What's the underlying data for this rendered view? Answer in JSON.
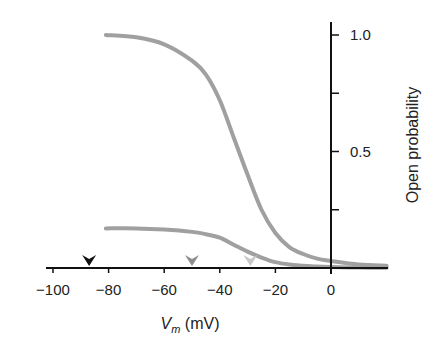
{
  "chart_data": {
    "type": "line",
    "title": "",
    "xlabel": "V_m (mV)",
    "xlabel_main": "V",
    "xlabel_sub": "m",
    "xlabel_unit": " (mV)",
    "ylabel": "Open probability",
    "xlim": [
      -100,
      20
    ],
    "ylim": [
      0,
      1.0
    ],
    "x_ticks": [
      -100,
      -80,
      -60,
      -40,
      -20,
      0
    ],
    "x_tick_labels": [
      "−100",
      "−80",
      "−60",
      "−40",
      "−20",
      "0"
    ],
    "y_ticks": [
      0.25,
      0.5,
      0.75,
      1.0
    ],
    "y_tick_labels": [
      "",
      "0.5",
      "",
      "1.0"
    ],
    "grid": false,
    "legend": null,
    "series": [
      {
        "name": "upper curve",
        "color": "#a0a0a0",
        "x": [
          -81,
          -70,
          -60,
          -50,
          -45,
          -40,
          -35,
          -30,
          -25,
          -20,
          -15,
          -10,
          -5,
          0,
          10,
          20
        ],
        "y": [
          1.0,
          0.99,
          0.96,
          0.89,
          0.83,
          0.72,
          0.56,
          0.4,
          0.25,
          0.15,
          0.09,
          0.06,
          0.04,
          0.03,
          0.015,
          0.01
        ]
      },
      {
        "name": "lower curve",
        "color": "#a0a0a0",
        "x": [
          -81,
          -70,
          -60,
          -50,
          -45,
          -40,
          -35,
          -30,
          -25,
          -20,
          -15,
          -10,
          -5,
          0,
          10,
          20
        ],
        "y": [
          0.17,
          0.17,
          0.165,
          0.155,
          0.145,
          0.13,
          0.1,
          0.07,
          0.045,
          0.025,
          0.015,
          0.01,
          0.006,
          0.004,
          0.002,
          0.001
        ]
      }
    ],
    "annotations": [
      {
        "type": "arrowhead",
        "x": -87,
        "color": "#111111",
        "label": "resting potential marker"
      },
      {
        "type": "arrowhead",
        "x": -50,
        "color": "#8c8c8c",
        "label": "marker"
      },
      {
        "type": "arrowhead",
        "x": -29,
        "color": "#c8c8c8",
        "label": "marker"
      }
    ]
  }
}
